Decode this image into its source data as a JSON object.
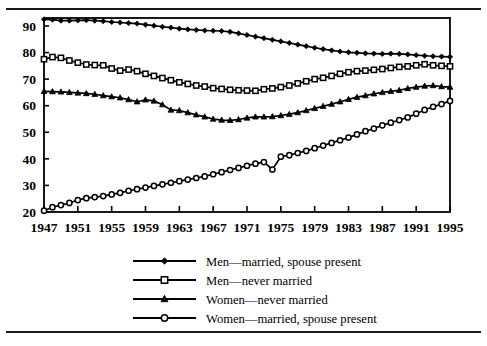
{
  "figure": {
    "has_top_rule": true,
    "has_bottom_rule": true,
    "frame_color": "#000000",
    "background": "#ffffff"
  },
  "axis": {
    "y_ticks": [
      "20",
      "30",
      "40",
      "50",
      "60",
      "70",
      "80",
      "90"
    ],
    "x_ticks": [
      "1947",
      "1951",
      "1955",
      "1959",
      "1963",
      "1967",
      "1971",
      "1975",
      "1979",
      "1983",
      "1987",
      "1991",
      "1995"
    ]
  },
  "legend": {
    "items": [
      {
        "label": "Men—married, spouse present",
        "marker": "filled-diamond"
      },
      {
        "label": "Men—never married",
        "marker": "open-square"
      },
      {
        "label": "Women—never married",
        "marker": "filled-triangle"
      },
      {
        "label": "Women—married, spouse present",
        "marker": "open-circle"
      }
    ]
  },
  "chart_data": {
    "type": "line",
    "title": "",
    "subtitle": "",
    "xlabel": "",
    "ylabel": "",
    "xlim": [
      1947,
      1995
    ],
    "ylim": [
      20,
      93
    ],
    "grid": false,
    "legend_position": "bottom-center",
    "x": [
      1947,
      1948,
      1949,
      1950,
      1951,
      1952,
      1953,
      1954,
      1955,
      1956,
      1957,
      1958,
      1959,
      1960,
      1961,
      1962,
      1963,
      1964,
      1965,
      1966,
      1967,
      1968,
      1969,
      1970,
      1971,
      1972,
      1973,
      1974,
      1975,
      1976,
      1977,
      1978,
      1979,
      1980,
      1981,
      1982,
      1983,
      1984,
      1985,
      1986,
      1987,
      1988,
      1989,
      1990,
      1991,
      1992,
      1993,
      1994,
      1995
    ],
    "series": [
      {
        "name": "Men—married, spouse present",
        "marker": "filled-diamond",
        "color": "#000000",
        "values": [
          92.5,
          92.4,
          92.0,
          92.0,
          92.1,
          92.2,
          92.0,
          91.8,
          91.5,
          91.3,
          91.1,
          90.9,
          90.5,
          90.1,
          89.7,
          89.4,
          89.0,
          88.7,
          88.5,
          88.3,
          88.2,
          88.1,
          87.8,
          87.2,
          86.6,
          86.0,
          85.4,
          84.8,
          84.2,
          83.6,
          83.0,
          82.4,
          81.8,
          81.3,
          80.8,
          80.4,
          80.1,
          79.9,
          79.7,
          79.6,
          79.5,
          79.6,
          79.5,
          79.3,
          79.0,
          78.8,
          78.6,
          78.5,
          78.4
        ]
      },
      {
        "name": "Men—never married",
        "marker": "open-square",
        "color": "#000000",
        "values": [
          77.5,
          78.3,
          78.0,
          77.0,
          76.2,
          75.5,
          75.3,
          75.2,
          74.0,
          73.2,
          73.6,
          73.0,
          72.0,
          71.2,
          70.4,
          69.6,
          68.8,
          68.2,
          67.6,
          67.2,
          66.6,
          66.3,
          66.0,
          65.8,
          65.7,
          65.6,
          66.2,
          66.5,
          67.0,
          67.6,
          68.4,
          69.2,
          70.0,
          70.5,
          71.2,
          72.0,
          72.6,
          73.0,
          73.2,
          73.5,
          73.8,
          74.2,
          74.6,
          74.8,
          75.2,
          75.6,
          75.2,
          75.0,
          74.8
        ]
      },
      {
        "name": "Women—never married",
        "marker": "filled-triangle",
        "color": "#000000",
        "values": [
          65.4,
          65.3,
          65.2,
          65.0,
          64.8,
          64.6,
          64.3,
          63.8,
          63.4,
          63.0,
          62.3,
          61.5,
          62.2,
          61.8,
          60.4,
          58.4,
          58.2,
          57.4,
          56.6,
          55.8,
          55.0,
          54.6,
          54.5,
          54.8,
          55.4,
          55.8,
          55.8,
          55.9,
          56.3,
          56.8,
          57.4,
          58.2,
          59.0,
          59.8,
          60.6,
          61.5,
          62.4,
          63.2,
          63.8,
          64.5,
          65.0,
          65.4,
          65.8,
          66.5,
          67.0,
          67.4,
          67.6,
          67.2,
          67.0
        ]
      },
      {
        "name": "Women—married, spouse present",
        "marker": "open-circle",
        "color": "#000000",
        "values": [
          20.5,
          21.8,
          22.6,
          23.4,
          24.5,
          25.2,
          25.6,
          26.0,
          26.6,
          27.2,
          28.0,
          28.6,
          29.2,
          29.8,
          30.4,
          31.0,
          31.6,
          32.2,
          32.8,
          33.4,
          34.2,
          35.0,
          35.8,
          36.6,
          37.4,
          38.2,
          38.8,
          36.0,
          40.8,
          41.4,
          42.2,
          43.0,
          44.0,
          45.0,
          46.0,
          47.0,
          48.0,
          49.2,
          50.4,
          51.4,
          52.6,
          53.6,
          54.6,
          55.6,
          57.0,
          58.4,
          59.6,
          60.6,
          61.8
        ]
      }
    ]
  }
}
